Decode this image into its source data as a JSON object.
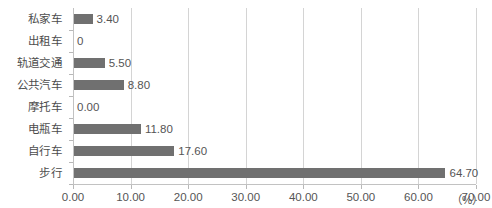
{
  "chart_data": {
    "type": "bar",
    "orientation": "horizontal",
    "title": "",
    "xlabel": "（%）",
    "ylabel": "",
    "categories": [
      "私家车",
      "出租车",
      "轨道交通",
      "公共汽车",
      "摩托车",
      "电瓶车",
      "自行车",
      "步行"
    ],
    "values": [
      3.4,
      0,
      5.5,
      8.8,
      0.0,
      11.8,
      17.6,
      64.7
    ],
    "value_labels": [
      "3.40",
      "0",
      "5.50",
      "8.80",
      "0.00",
      "11.80",
      "17.60",
      "64.70"
    ],
    "xlim": [
      0,
      70
    ],
    "xticks": [
      0,
      10,
      20,
      30,
      40,
      50,
      60,
      70
    ],
    "xtick_labels": [
      "0.00",
      "10.00",
      "20.00",
      "30.00",
      "40.00",
      "50.00",
      "60.00",
      "70.00"
    ],
    "grid": true,
    "grid_axis": "x",
    "legend": false,
    "bar_color": "#707070",
    "gridline_color": "#d4d4d4",
    "axis_color": "#c2c2c2",
    "text_color": "#555555",
    "background_color": "#ffffff"
  }
}
